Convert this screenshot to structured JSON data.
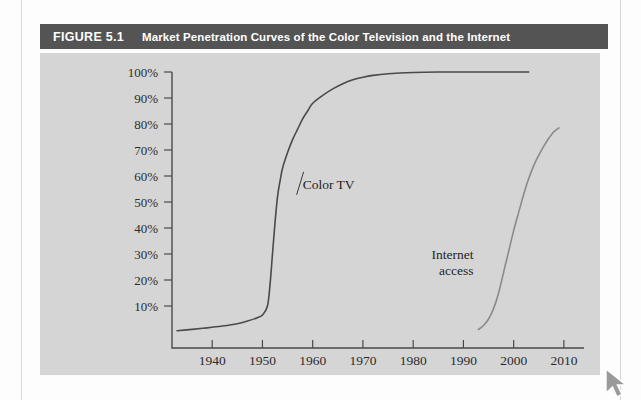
{
  "figure": {
    "number": "FIGURE 5.1",
    "caption": "Market Penetration Curves of the Color Television and the Internet"
  },
  "colors": {
    "title_bar": "#545454",
    "title_text": "#ffffff",
    "panel_background": "#d5d5d5",
    "page_background": "#fdfdfd",
    "axis": "#4a4a4a",
    "color_tv_curve": "#4a4a4a",
    "internet_curve": "#8a8a8a"
  },
  "cursor": {
    "icon": "mouse-pointer-icon",
    "label": "Copy"
  },
  "chart_data": {
    "type": "line",
    "title": "Market Penetration Curves of the Color Television and the Internet",
    "xlabel": "",
    "ylabel": "",
    "xlim": [
      1932,
      2014
    ],
    "ylim": [
      0,
      100
    ],
    "grid": false,
    "legend": "inline-annotations",
    "xticks": [
      1940,
      1950,
      1960,
      1970,
      1980,
      1990,
      2000,
      2010
    ],
    "xtick_labels": [
      "1940",
      "1950",
      "1960",
      "1970",
      "1980",
      "1990",
      "2000",
      "2010"
    ],
    "yticks": [
      10,
      20,
      30,
      40,
      50,
      60,
      70,
      80,
      90,
      100
    ],
    "ytick_labels": [
      "10%",
      "20%",
      "30%",
      "40%",
      "50%",
      "60%",
      "70%",
      "80%",
      "90%",
      "100%"
    ],
    "series": [
      {
        "name": "Color TV",
        "annotation": "Color TV",
        "annotation_x": 1958,
        "annotation_y": 57,
        "x": [
          1933,
          1936,
          1939,
          1942,
          1945,
          1947,
          1949,
          1950,
          1951,
          1951.5,
          1952,
          1952.5,
          1953,
          1953.5,
          1954,
          1955,
          1956,
          1957,
          1958,
          1959,
          1960,
          1962,
          1964,
          1966,
          1968,
          1970,
          1972,
          1975,
          1980,
          1985,
          1990,
          1995,
          2000,
          2003
        ],
        "y": [
          0.5,
          1,
          1.6,
          2.3,
          3.2,
          4.2,
          5.5,
          6.5,
          10,
          18,
          30,
          42,
          52,
          58,
          63,
          69,
          74,
          78,
          82,
          85,
          88,
          91,
          93.5,
          95.5,
          97,
          98,
          98.7,
          99.3,
          99.8,
          100,
          100,
          100,
          100,
          100
        ]
      },
      {
        "name": "Internet access",
        "annotation": "Internet\naccess",
        "annotation_x": 1992,
        "annotation_y": 28,
        "x": [
          1993,
          1994,
          1995,
          1996,
          1997,
          1998,
          1999,
          2000,
          2001,
          2002,
          2003,
          2004,
          2005,
          2006,
          2007,
          2008,
          2009
        ],
        "y": [
          1,
          2.5,
          5,
          9,
          15,
          23,
          31,
          39,
          46,
          53,
          59,
          64,
          68,
          71.5,
          74.5,
          77,
          78.5
        ]
      }
    ]
  }
}
